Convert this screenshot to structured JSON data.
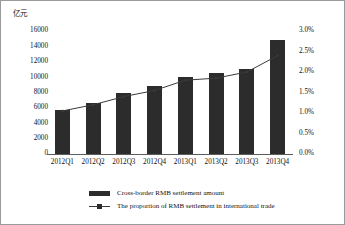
{
  "chart_data": {
    "type": "bar",
    "title": "",
    "subtitle": "",
    "unit_label": "亿元",
    "xlabel": "",
    "ylabel": "",
    "categories": [
      "2012Q1",
      "2012Q2",
      "2012Q3",
      "2012Q4",
      "2013Q1",
      "2013Q2",
      "2013Q3",
      "2013Q4"
    ],
    "series": [
      {
        "name": "Cross-border RMB settlement amount",
        "type": "bar",
        "axis": "left",
        "unit": "亿元",
        "values": [
          5700,
          6650,
          7900,
          8900,
          10000,
          10550,
          11100,
          14800
        ],
        "color": "#2c2c2c"
      },
      {
        "name": "The proportion of RMB settlement in international trade",
        "type": "line",
        "axis": "right",
        "unit": "%",
        "values": [
          1.05,
          1.2,
          1.4,
          1.55,
          1.8,
          1.85,
          2.0,
          2.4
        ],
        "color": "#3a3a3a"
      }
    ],
    "left_axis": {
      "min": 0,
      "max": 16000,
      "step": 2000,
      "ticks": [
        "0",
        "2000",
        "4000",
        "6000",
        "8000",
        "10000",
        "12000",
        "14000",
        "16000"
      ]
    },
    "right_axis": {
      "min": 0,
      "max": 3.0,
      "step": 0.5,
      "ticks": [
        "0.0%",
        "0.5%",
        "1.0%",
        "1.5%",
        "2.0%",
        "2.5%",
        "3.0%"
      ]
    },
    "grid": false,
    "legend_position": "bottom",
    "legend": [
      {
        "label": "Cross-border RMB settlement amount",
        "key": "bar-swatch"
      },
      {
        "label": "The proportion of RMB settlement in international trade",
        "key": "line-swatch"
      }
    ]
  }
}
